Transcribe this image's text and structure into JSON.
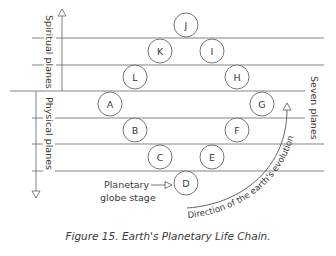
{
  "figure": {
    "caption": "Figure 15. Earth's Planetary Life Chain.",
    "labels": {
      "spiritual_axis": "Spiritual planes",
      "physical_axis": "Physical planes",
      "seven_planes": "Seven planes",
      "planetary_line1": "Planetary",
      "planetary_line2": "globe stage",
      "evolution": "Direction of the earth's evolution"
    },
    "globes": [
      {
        "label": "J",
        "cx": 186,
        "cy": 25
      },
      {
        "label": "K",
        "cx": 160,
        "cy": 51
      },
      {
        "label": "I",
        "cx": 212,
        "cy": 51
      },
      {
        "label": "L",
        "cx": 135,
        "cy": 77
      },
      {
        "label": "H",
        "cx": 237,
        "cy": 77
      },
      {
        "label": "A",
        "cx": 110,
        "cy": 104
      },
      {
        "label": "G",
        "cx": 262,
        "cy": 104
      },
      {
        "label": "B",
        "cx": 135,
        "cy": 130
      },
      {
        "label": "F",
        "cx": 237,
        "cy": 130
      },
      {
        "label": "C",
        "cx": 160,
        "cy": 157
      },
      {
        "label": "E",
        "cx": 212,
        "cy": 157
      },
      {
        "label": "D",
        "cx": 186,
        "cy": 183
      }
    ],
    "colors": {
      "line": "#555555",
      "text": "#3a3a3a"
    }
  }
}
